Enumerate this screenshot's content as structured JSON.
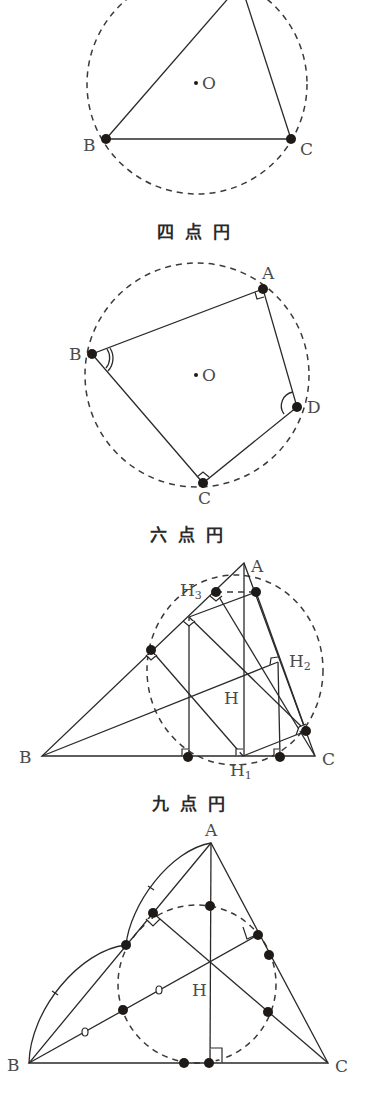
{
  "titles": {
    "four_point": "四点円",
    "six_point": "六点円",
    "nine_point": "九点円"
  },
  "diagram1": {
    "labels": {
      "B": "B",
      "C": "C",
      "O": "O"
    }
  },
  "diagram2": {
    "labels": {
      "A": "A",
      "B": "B",
      "C": "C",
      "D": "D",
      "O": "O"
    }
  },
  "diagram3": {
    "labels": {
      "A": "A",
      "B": "B",
      "C": "C",
      "H": "H",
      "H1": "H",
      "H1_sub": "1",
      "H2": "H",
      "H2_sub": "2",
      "H3": "H",
      "H3_sub": "3"
    }
  },
  "diagram4": {
    "labels": {
      "A": "A",
      "B": "B",
      "C": "C",
      "H": "H"
    }
  }
}
